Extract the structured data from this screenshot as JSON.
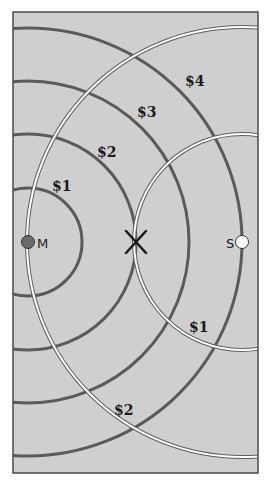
{
  "diagram": {
    "type": "location-model-concentric-costs",
    "colors": {
      "background": "#cfcfcf",
      "frame": "#4a4a4a",
      "market_circles": "#5a5a5a",
      "source_circles": "#ffffff",
      "source_circle_outline": "#555555",
      "market_dot": "#6b6b6b",
      "source_dot": "#ffffff",
      "optimum_mark": "#1a1a1a"
    },
    "points": {
      "market": {
        "label": "M",
        "x": 28,
        "y": 242
      },
      "source": {
        "label": "S",
        "x": 242,
        "y": 242
      },
      "optimum": {
        "symbol": "X",
        "x": 136,
        "y": 242
      }
    },
    "market_isolines": [
      {
        "label": "$1",
        "radius": 54
      },
      {
        "label": "$2",
        "radius": 108
      },
      {
        "label": "$3",
        "radius": 161
      },
      {
        "label": "$4",
        "radius": 214
      }
    ],
    "source_isolines": [
      {
        "label": "$1",
        "radius": 108
      },
      {
        "label": "$2",
        "radius": 215
      }
    ],
    "labels": {
      "m1": "$1",
      "m2": "$2",
      "m3": "$3",
      "m4": "$4",
      "s1": "$1",
      "s2": "$2",
      "market": "M",
      "source": "S"
    }
  }
}
